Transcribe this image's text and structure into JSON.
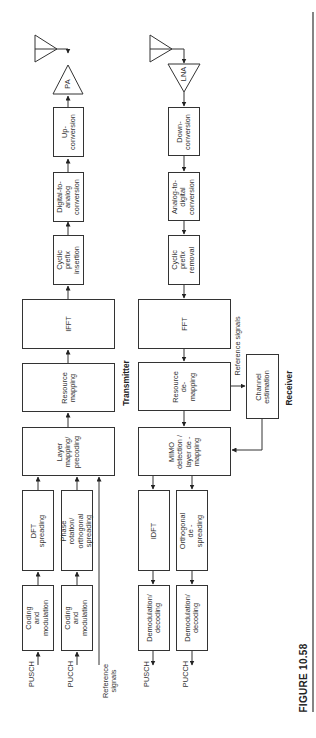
{
  "figure": {
    "caption": "FIGURE 10.58"
  },
  "transmitter": {
    "title": "Transmitter",
    "inputs": {
      "pusch": "PUSCH",
      "pucch": "PUCCH",
      "reference": "Reference\nsignals"
    },
    "blocks": {
      "coding_pusch": "Coding and\nmodulation",
      "coding_pucch": "Coding and\nmodulation",
      "dft_spreading": "DFT spreading",
      "phase_rotation": "Phase rotation/\northogonal\nspreading",
      "layer_mapping": "Layer\nmapping/\nprecoding",
      "resource_mapping": "Resource\nmapping",
      "ifft": "IFFT",
      "cp_insertion": "Cyclic\nprefix\ninsertion",
      "dac": "Digital-to-\nanalog\nconversion",
      "upconversion": "Up-\nconversion",
      "pa": "PA"
    }
  },
  "receiver": {
    "title": "Receiver",
    "outputs": {
      "pusch": "PUSCH",
      "pucch": "PUCCH"
    },
    "reference_label": "Reference signals",
    "blocks": {
      "lna": "LNA",
      "downconversion": "Down-\nconversion",
      "adc": "Analog-to-\ndigital\nconversion",
      "cp_removal": "Cyclic\nprefix\nremoval",
      "fft": "FFT",
      "resource_demapping": "Resource\nde-\nmapping",
      "channel_estimation": "Channel\nestimation",
      "mimo_detection": "MIMO\ndetection /\nlayer de -\nmapping",
      "idft": "IDFT",
      "orthogonal_despreading": "Orthogonal de -\nspreading",
      "demod_pusch": "Demodulation/\ndecoding",
      "demod_pucch": "Demodulation/\ndecoding"
    }
  },
  "colors": {
    "line": "#333333",
    "background": "#ffffff"
  }
}
